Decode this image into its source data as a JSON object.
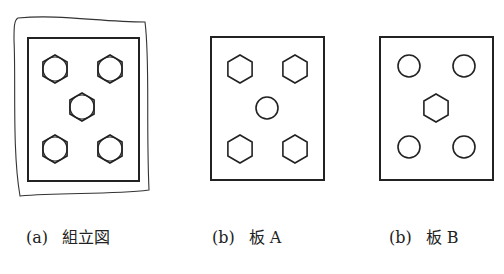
{
  "figures": [
    {
      "id": "a",
      "label": "(a)",
      "title": "組立図",
      "description": "assembly drawing: plate with 5 bolts (hex heads with inner circles), wavy outline"
    },
    {
      "id": "b",
      "label": "(b)",
      "title": "板 A",
      "description": "plate A: 4 hexagonal holes at corners, 1 round hole at center"
    },
    {
      "id": "c",
      "label": "(b)",
      "title": "板 B",
      "description": "plate B: 4 round holes at corners, 1 hexagonal hole at center"
    }
  ],
  "colors": {
    "stroke": "#222222",
    "background": "#ffffff"
  }
}
